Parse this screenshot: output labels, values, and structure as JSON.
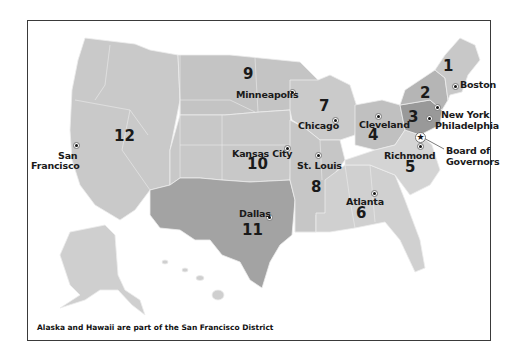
{
  "map": {
    "title": "Federal Reserve Districts",
    "caption": "Alaska and Hawaii are part of the San Francisco District",
    "colors": {
      "district_light": "#d2d2d2",
      "district_mid": "#c2c2c2",
      "district_dark": "#a8a8a8",
      "district_darkest": "#9a9a9a",
      "state_border": "#e8e8e8",
      "frame": "#3a3a3a"
    },
    "districts": [
      {
        "number": "1",
        "city": "Boston"
      },
      {
        "number": "2",
        "city": "New York"
      },
      {
        "number": "3",
        "city": "Philadelphia"
      },
      {
        "number": "4",
        "city": "Cleveland"
      },
      {
        "number": "5",
        "city": "Richmond"
      },
      {
        "number": "6",
        "city": "Atlanta"
      },
      {
        "number": "7",
        "city": "Chicago"
      },
      {
        "number": "8",
        "city": "St. Louis"
      },
      {
        "number": "9",
        "city": "Minneapolis"
      },
      {
        "number": "10",
        "city": "Kansas City"
      },
      {
        "number": "11",
        "city": "Dallas"
      },
      {
        "number": "12",
        "city": "San Francisco"
      }
    ],
    "board": {
      "line1": "Board of",
      "line2": "Governors",
      "icon": "star-icon"
    },
    "sf_label": {
      "line1": "San",
      "line2": "Francisco"
    }
  }
}
